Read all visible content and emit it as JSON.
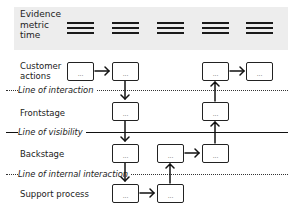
{
  "evidence": {
    "label_lines": [
      "Evidence",
      "metric",
      "time"
    ],
    "columns": 5,
    "icon": "three-bar-placeholder-icon"
  },
  "lanes": [
    {
      "id": "customer-actions",
      "label_lines": [
        "Customer",
        "actions"
      ]
    },
    {
      "id": "frontstage",
      "label_lines": [
        "Frontstage"
      ]
    },
    {
      "id": "backstage",
      "label_lines": [
        "Backstage"
      ]
    },
    {
      "id": "support-process",
      "label_lines": [
        "Support process"
      ]
    }
  ],
  "lines": [
    {
      "id": "line-of-interaction",
      "label": "Line of interaction",
      "style": "dotted"
    },
    {
      "id": "line-of-visibility",
      "label": "Line of visibility",
      "style": "solid"
    },
    {
      "id": "line-of-internal-interaction",
      "label": "Line of internal interaction",
      "style": "dotted"
    }
  ],
  "box_text": "...",
  "boxes": [
    {
      "lane": "customer-actions",
      "col": 1
    },
    {
      "lane": "customer-actions",
      "col": 2
    },
    {
      "lane": "customer-actions",
      "col": 4
    },
    {
      "lane": "customer-actions",
      "col": 5
    },
    {
      "lane": "frontstage",
      "col": 2
    },
    {
      "lane": "frontstage",
      "col": 4
    },
    {
      "lane": "backstage",
      "col": 2
    },
    {
      "lane": "backstage",
      "col": 3
    },
    {
      "lane": "backstage",
      "col": 4
    },
    {
      "lane": "support-process",
      "col": 2
    },
    {
      "lane": "support-process",
      "col": 3
    }
  ],
  "flow": [
    "customer-actions:1 -> customer-actions:2",
    "customer-actions:2 -> frontstage:2",
    "frontstage:2 -> backstage:2",
    "backstage:2 -> support-process:2",
    "support-process:2 -> support-process:3",
    "support-process:3 -> backstage:3",
    "backstage:3 -> backstage:4",
    "backstage:4 -> frontstage:4",
    "frontstage:4 -> customer-actions:4",
    "customer-actions:4 -> customer-actions:5"
  ]
}
